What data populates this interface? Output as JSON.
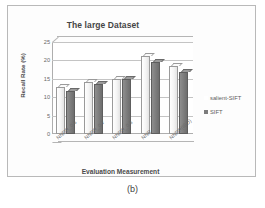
{
  "caption": "(b)",
  "legend": {
    "position": "right",
    "entries": [
      {
        "label": "salient-SIFT",
        "color": "#ffffff"
      },
      {
        "label": "SIFT",
        "color": "#7c7c7c"
      }
    ]
  },
  "chart_data": {
    "type": "bar",
    "title": "The large Dataset",
    "xlabel": "Evaluation Measurement",
    "ylabel": "Recall Rate (%)",
    "categories": [
      "NNDR_0.6",
      "NNDR_0.7",
      "NNDR_0.8",
      "NNR",
      "NNDR(ISO)"
    ],
    "series": [
      {
        "name": "salient-SIFT",
        "values": [
          12.8,
          14.2,
          15.0,
          21.3,
          18.4
        ]
      },
      {
        "name": "SIFT",
        "values": [
          11.6,
          13.5,
          15.0,
          19.5,
          16.8
        ]
      }
    ],
    "ylim": [
      0,
      25
    ],
    "ytick_labels": [
      "0",
      "5",
      "10",
      "15",
      "20",
      "25"
    ],
    "ytick_values": [
      0,
      5,
      10,
      15,
      20,
      25
    ],
    "grid": true
  }
}
